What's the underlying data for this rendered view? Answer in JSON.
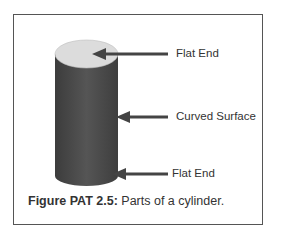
{
  "figure": {
    "labels": {
      "top": "Flat End",
      "middle": "Curved Surface",
      "bottom": "Flat End"
    },
    "caption": {
      "number": "Figure PAT 2.5:",
      "text": "Parts of a cylinder."
    },
    "colors": {
      "cylinder_body": "#4a4a4a",
      "cylinder_top": "#dcdcdc",
      "arrow": "#444444",
      "frame": "#555555",
      "text": "#333333"
    }
  }
}
